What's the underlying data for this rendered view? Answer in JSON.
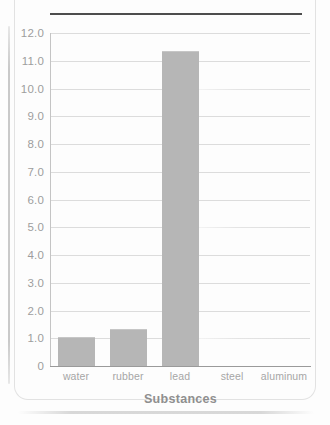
{
  "chart_data": {
    "type": "bar",
    "title": "",
    "xlabel": "Substances",
    "ylabel": "",
    "categories": [
      "water",
      "rubber",
      "lead",
      "steel",
      "aluminum"
    ],
    "values": [
      1.0,
      1.3,
      11.3,
      0,
      0
    ],
    "ylim": [
      0,
      12.0
    ],
    "ytick_labels": [
      "12.0",
      "11.0",
      "10.0",
      "9.0",
      "8.0",
      "7.0",
      "6.0",
      "5.0",
      "4.0",
      "3.0",
      "2.0",
      "1.0",
      "0"
    ],
    "ytick_values": [
      12.0,
      11.0,
      10.0,
      9.0,
      8.0,
      7.0,
      6.0,
      5.0,
      4.0,
      3.0,
      2.0,
      1.0,
      0
    ],
    "grid": true,
    "legend": null,
    "bar_color": "#b6b6b6",
    "gridline_color": "#dcdcdc",
    "tick_label_color": "#9d9d9d",
    "axis_title_color": "#8f8f8f"
  },
  "axis": {
    "x_title": "Substances"
  }
}
